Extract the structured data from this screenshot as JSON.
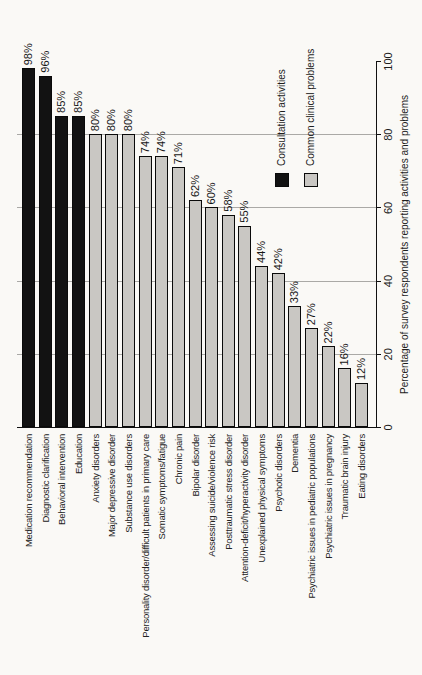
{
  "figure": {
    "background_color": "#faf9f6",
    "bar_border_color": "#0a0a0a",
    "gridline_color": "#9b9b98",
    "text_color": "#1d1d1d",
    "rotation_note": "entire landscape chart rotated 90 degrees counterclockwise onto a portrait page"
  },
  "chart_data": {
    "type": "bar",
    "title": "",
    "categories": [
      "Medication recommendation",
      "Diagnostic clarification",
      "Behavioral intervention",
      "Education",
      "Anxiety disorders",
      "Major depressive disorder",
      "Substance use disorders",
      "Personality disorder/difficult patients in primary care",
      "Somatic symptoms/fatigue",
      "Chronic pain",
      "Bipolar disorder",
      "Assessing suicide/violence risk",
      "Posttraumatic stress disorder",
      "Attention-deficit/hyperactivity disorder",
      "Unexplained physical symptoms",
      "Psychotic disorders",
      "Dementia",
      "Psychiatric issues in pediatric populations",
      "Psychiatric issues in pregnancy",
      "Traumatic brain injury",
      "Eating disorders"
    ],
    "values": [
      98,
      96,
      85,
      85,
      80,
      80,
      80,
      74,
      74,
      71,
      62,
      60,
      58,
      55,
      44,
      42,
      33,
      27,
      22,
      16,
      12
    ],
    "value_labels": [
      "98%",
      "96%",
      "85%",
      "85%",
      "80%",
      "80%",
      "80%",
      "74%",
      "74%",
      "71%",
      "62%",
      "60%",
      "58%",
      "55%",
      "44%",
      "42%",
      "33%",
      "27%",
      "22%",
      "16%",
      "12%"
    ],
    "bar_groups": [
      0,
      0,
      0,
      0,
      1,
      1,
      1,
      1,
      1,
      1,
      1,
      1,
      1,
      1,
      1,
      1,
      1,
      1,
      1,
      1,
      1
    ],
    "legend": {
      "position": "inside plot area",
      "entries": [
        {
          "label": "Consultation activities",
          "color": "#121212"
        },
        {
          "label": "Common clinical problems",
          "color": "#c9c7c3"
        }
      ]
    },
    "axis": {
      "label": "Percentage of survey respondents reporting activities and problems",
      "ticks": [
        0,
        20,
        40,
        60,
        80,
        100
      ],
      "range": [
        0,
        100
      ],
      "grid": true,
      "gridline_ticks": [
        20,
        40,
        60,
        80
      ]
    }
  }
}
